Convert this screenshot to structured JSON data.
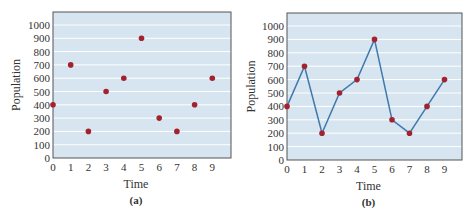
{
  "chart_data": [
    {
      "type": "scatter",
      "caption": "(a)",
      "xlabel": "Time",
      "ylabel": "Population",
      "x": [
        0,
        1,
        2,
        3,
        4,
        5,
        6,
        7,
        8,
        9
      ],
      "y": [
        400,
        700,
        200,
        500,
        600,
        900,
        300,
        200,
        400,
        600
      ],
      "xticks": [
        "0",
        "1",
        "2",
        "3",
        "4",
        "5",
        "6",
        "7",
        "8",
        "9"
      ],
      "yticks": [
        "0",
        "100",
        "200",
        "300",
        "400",
        "500",
        "600",
        "700",
        "800",
        "900",
        "1000"
      ],
      "ylim": [
        0,
        1000
      ],
      "grid": "horizontal",
      "colors": {
        "background": "#d6e5ef",
        "grid": "#ffffff",
        "marker": "#a3222e",
        "frame": "#555555"
      }
    },
    {
      "type": "line",
      "caption": "(b)",
      "xlabel": "Time",
      "ylabel": "Population",
      "x": [
        0,
        1,
        2,
        3,
        4,
        5,
        6,
        7,
        8,
        9
      ],
      "y": [
        400,
        700,
        200,
        500,
        600,
        900,
        300,
        200,
        400,
        600
      ],
      "xticks": [
        "0",
        "1",
        "2",
        "3",
        "4",
        "5",
        "6",
        "7",
        "8",
        "9"
      ],
      "yticks": [
        "0",
        "100",
        "200",
        "300",
        "400",
        "500",
        "600",
        "700",
        "800",
        "900",
        "1000"
      ],
      "ylim": [
        0,
        1000
      ],
      "grid": "horizontal",
      "colors": {
        "background": "#d6e5ef",
        "grid": "#ffffff",
        "marker": "#a3222e",
        "line": "#3f78ad",
        "frame": "#555555"
      }
    }
  ]
}
